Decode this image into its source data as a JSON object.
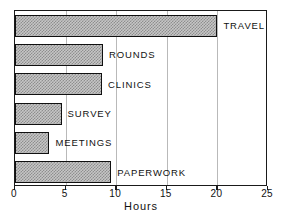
{
  "chart_data": {
    "type": "bar",
    "orientation": "horizontal",
    "title": "",
    "xlabel": "Hours",
    "ylabel": "",
    "xlim": [
      0,
      25
    ],
    "xticks": [
      0,
      5,
      10,
      15,
      20,
      25
    ],
    "xtick_labels": [
      "0",
      "5",
      "10",
      "15",
      "20",
      "25"
    ],
    "grid": true,
    "grid_axis": "x",
    "legend": false,
    "categories": [
      "TRAVEL",
      "ROUNDS",
      "CLINICS",
      "SURVEY",
      "MEETINGS",
      "PAPERWORK"
    ],
    "values": [
      20.0,
      8.7,
      8.6,
      4.6,
      3.4,
      9.5
    ],
    "bars": [
      {
        "label": "TRAVEL",
        "value": 20.0
      },
      {
        "label": "ROUNDS",
        "value": 8.7
      },
      {
        "label": "CLINICS",
        "value": 8.6
      },
      {
        "label": "SURVEY",
        "value": 4.6
      },
      {
        "label": "MEETINGS",
        "value": 3.4
      },
      {
        "label": "PAPERWORK",
        "value": 9.5
      }
    ],
    "bar_fill_color": "#c6c6c6",
    "bar_edge_color": "#101010",
    "grid_color": "#b9b9b9",
    "axis_color": "#1a1a1a",
    "background_color": "#ffffff"
  }
}
